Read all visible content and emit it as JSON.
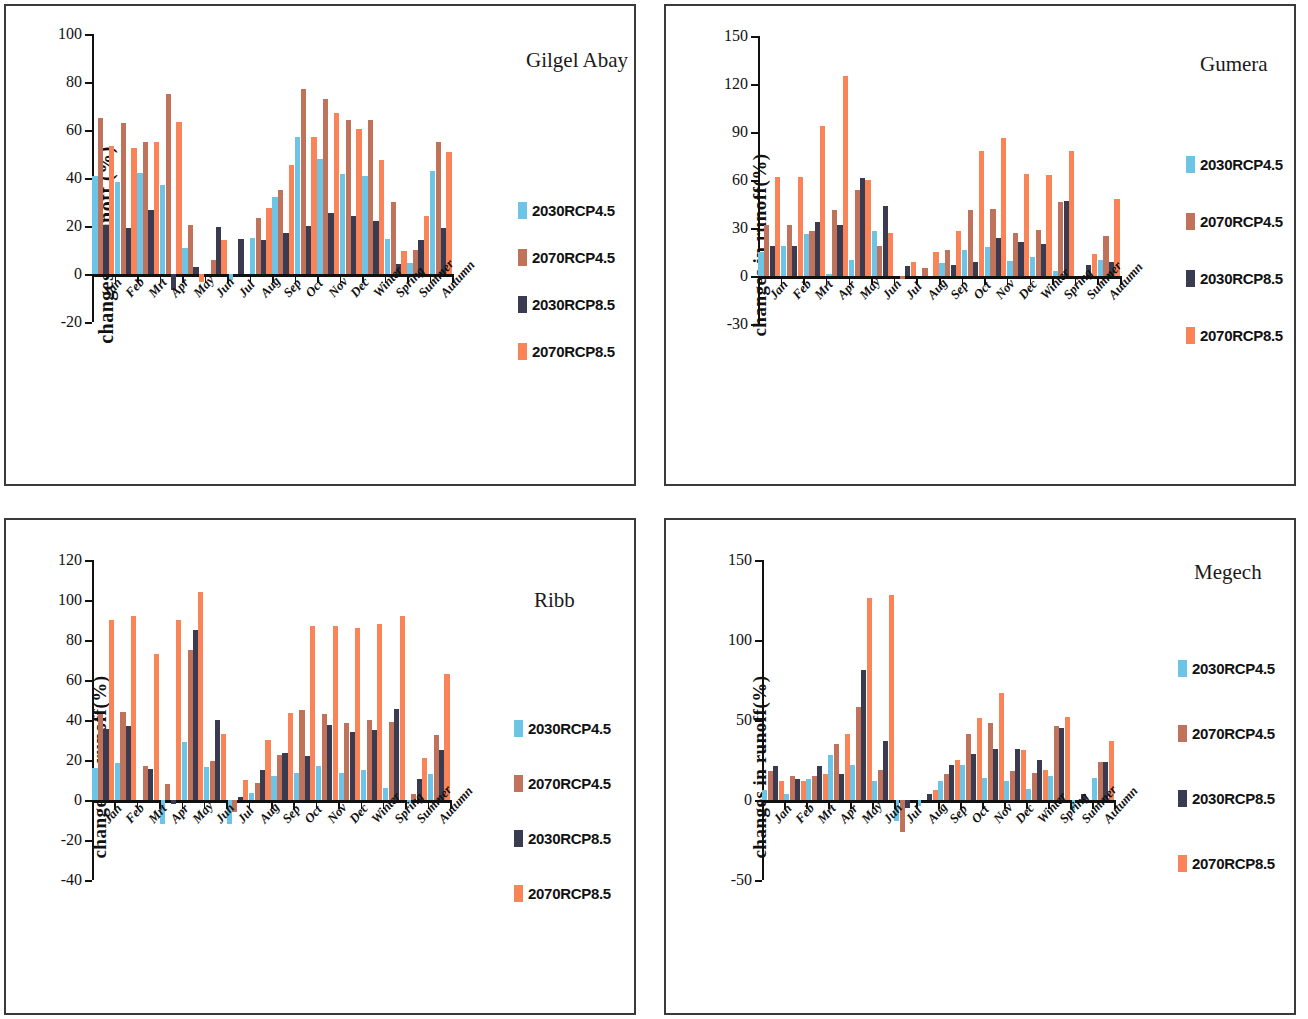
{
  "figure": {
    "categories": [
      "Jan",
      "Feb",
      "Mrt",
      "Apr",
      "May",
      "Jun",
      "Jul",
      "Aug",
      "Sep",
      "Oct",
      "Nov",
      "Dec",
      "Winter",
      "Spring",
      "Summer",
      "Autumn"
    ],
    "series_names": [
      "2030RCP4.5",
      "2070RCP4.5",
      "2030RCP8.5",
      "2070RCP8.5"
    ],
    "colors": {
      "2030RCP4.5": "#6CC5E6",
      "2070RCP4.5": "#C0725A",
      "2030RCP8.5": "#3A3B50",
      "2070RCP8.5": "#FA8358"
    }
  },
  "panels": [
    {
      "id": "gilgel-abay",
      "basin_label": "Gilgel Abay",
      "ylabel": "changes in runoff (%)",
      "yticks": [
        "100",
        "80",
        "60",
        "40",
        "20",
        "0",
        "-20"
      ]
    },
    {
      "id": "gumera",
      "basin_label": "Gumera",
      "ylabel": "changes in runoff(%)",
      "yticks": [
        "150",
        "120",
        "90",
        "60",
        "30",
        "0",
        "-30"
      ]
    },
    {
      "id": "ribb",
      "basin_label": "Ribb",
      "ylabel": "changes in runoff(%)",
      "yticks": [
        "120",
        "100",
        "80",
        "60",
        "40",
        "20",
        "0",
        "-20",
        "-40"
      ]
    },
    {
      "id": "megech",
      "basin_label": "Megech",
      "ylabel": "changes in runoff(%)",
      "yticks": [
        "150",
        "100",
        "50",
        "0",
        "-50"
      ]
    }
  ],
  "chart_data": [
    {
      "type": "bar",
      "title": "Gilgel Abay",
      "xlabel": "",
      "ylabel": "changes in runoff (%)",
      "ylim": [
        -20,
        100
      ],
      "ytick_step": 20,
      "grid": false,
      "legend_position": "right",
      "categories": [
        "Jan",
        "Feb",
        "Mrt",
        "Apr",
        "May",
        "Jun",
        "Jul",
        "Aug",
        "Sep",
        "Oct",
        "Nov",
        "Dec",
        "Winter",
        "Spring",
        "Summer",
        "Autumn"
      ],
      "series": [
        {
          "name": "2030RCP4.5",
          "values": [
            41,
            38.5,
            42,
            37,
            11,
            0,
            -2.5,
            15,
            32,
            57,
            48,
            41.5,
            41,
            14.5,
            4.5,
            43
          ]
        },
        {
          "name": "2070RCP4.5",
          "values": [
            65,
            63,
            55,
            75,
            20.5,
            6,
            0,
            23.5,
            35,
            77,
            73,
            64,
            64,
            30,
            10,
            55
          ]
        },
        {
          "name": "2030RCP8.5",
          "values": [
            20.5,
            19,
            26.5,
            -6.5,
            3,
            19.5,
            14.5,
            14,
            17,
            20,
            25.5,
            24,
            22,
            4,
            14,
            19
          ]
        },
        {
          "name": "2070RCP8.5",
          "values": [
            53.5,
            52.5,
            55,
            63.5,
            -3.5,
            14,
            0,
            27.5,
            45.5,
            57,
            67,
            60.5,
            47.5,
            9.5,
            24,
            51
          ]
        }
      ]
    },
    {
      "type": "bar",
      "title": "Gumera",
      "xlabel": "",
      "ylabel": "changes in runoff(%)",
      "ylim": [
        -30,
        150
      ],
      "ytick_step": 30,
      "grid": false,
      "legend_position": "right",
      "categories": [
        "Jan",
        "Feb",
        "Mrt",
        "Apr",
        "May",
        "Jun",
        "Jul",
        "Aug",
        "Sep",
        "Oct",
        "Nov",
        "Dec",
        "Winter",
        "Spring",
        "Summer",
        "Autumn"
      ],
      "series": [
        {
          "name": "2030RCP4.5",
          "values": [
            15,
            19,
            26,
            1.5,
            10,
            28,
            0,
            0,
            8,
            16,
            18,
            9.5,
            12,
            3,
            0,
            10
          ]
        },
        {
          "name": "2070RCP4.5",
          "values": [
            32,
            32,
            28,
            41,
            54,
            19,
            -2,
            5,
            16,
            41,
            42,
            27,
            29,
            46,
            0,
            25
          ]
        },
        {
          "name": "2030RCP8.5",
          "values": [
            19,
            19,
            34,
            32,
            61,
            44,
            6,
            0,
            7,
            9,
            24,
            21,
            20,
            47,
            7,
            9
          ]
        },
        {
          "name": "2070RCP8.5",
          "values": [
            62,
            62,
            94,
            125,
            60,
            27,
            9,
            15,
            28,
            78,
            86,
            64,
            63,
            78,
            14,
            48
          ]
        }
      ]
    },
    {
      "type": "bar",
      "title": "Ribb",
      "xlabel": "",
      "ylabel": "changes in runoff(%)",
      "ylim": [
        -40,
        120
      ],
      "ytick_step": 20,
      "grid": false,
      "legend_position": "right",
      "categories": [
        "Jan",
        "Feb",
        "Mrt",
        "Apr",
        "May",
        "Jun",
        "Jul",
        "Aug",
        "Sep",
        "Oct",
        "Nov",
        "Dec",
        "Winter",
        "Spring",
        "Summer",
        "Autumn"
      ],
      "series": [
        {
          "name": "2030RCP4.5",
          "values": [
            16,
            18.5,
            0,
            -12,
            29,
            16.5,
            -12,
            3.5,
            12,
            13.5,
            17,
            13.5,
            15,
            6,
            -1.5,
            13
          ]
        },
        {
          "name": "2070RCP4.5",
          "values": [
            43,
            44,
            17,
            8,
            75,
            19.5,
            -6,
            8.5,
            22.5,
            45,
            43,
            38.5,
            40,
            39,
            3,
            32.5
          ]
        },
        {
          "name": "2030RCP8.5",
          "values": [
            35.5,
            37,
            15.5,
            -2,
            85,
            40,
            1.5,
            15,
            23.5,
            22,
            37.5,
            34,
            35,
            45.5,
            10.5,
            25
          ]
        },
        {
          "name": "2070RCP8.5",
          "values": [
            90,
            92,
            73,
            90,
            104,
            33,
            10,
            30,
            43.5,
            87,
            87,
            86,
            88,
            92,
            21,
            63
          ]
        }
      ]
    },
    {
      "type": "bar",
      "title": "Megech",
      "xlabel": "",
      "ylabel": "changes in runoff(%)",
      "ylim": [
        -50,
        150
      ],
      "ytick_step": 50,
      "grid": false,
      "legend_position": "right",
      "categories": [
        "Jan",
        "Feb",
        "Mrt",
        "Apr",
        "May",
        "Jun",
        "Jul",
        "Aug",
        "Sep",
        "Oct",
        "Nov",
        "Dec",
        "Winter",
        "Spring",
        "Summer",
        "Autumn"
      ],
      "series": [
        {
          "name": "2030RCP4.5",
          "values": [
            6,
            4,
            13,
            28,
            22,
            12,
            -13,
            -4,
            12,
            22,
            14,
            12,
            7,
            15,
            -6,
            14
          ]
        },
        {
          "name": "2070RCP4.5",
          "values": [
            18,
            15,
            15,
            35,
            58,
            19,
            -20,
            0,
            16,
            41,
            48,
            18,
            17,
            46,
            0,
            24
          ]
        },
        {
          "name": "2030RCP8.5",
          "values": [
            21,
            13,
            21,
            16,
            81,
            37,
            -5,
            4,
            22,
            29,
            32,
            32,
            25,
            45,
            4,
            24
          ]
        },
        {
          "name": "2070RCP8.5",
          "values": [
            12,
            12,
            16,
            41,
            126,
            128,
            0,
            6,
            25,
            51,
            67,
            31,
            19,
            52,
            0,
            37
          ]
        }
      ]
    }
  ]
}
